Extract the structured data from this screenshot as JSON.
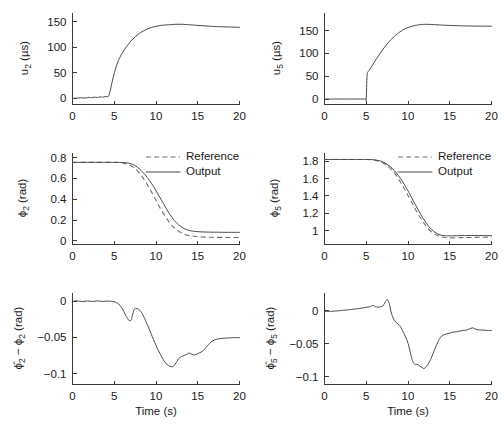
{
  "figure": {
    "background": "#ffffff",
    "line_color": "#4a4a4a",
    "dash_color": "#6e6e6e",
    "axis_color": "#3c3c3c",
    "rows": 3,
    "cols": 2
  },
  "labels": {
    "time_axis": "Time (s)",
    "legend_reference": "Reference",
    "legend_output": "Output",
    "u2_axis": "u₂ (μs)",
    "u5_axis": "u₅ (μs)",
    "phi2_axis": "ϕ₂ (rad)",
    "phi5_axis": "ϕ₅ (rad)",
    "err2_axis": "ϕ̂2 − ϕ₂ (rad)",
    "err5_axis": "ϕ̂5 − ϕ₅ (rad)"
  },
  "chart_data": [
    {
      "id": "u2",
      "type": "line",
      "title": "",
      "xlabel": "",
      "ylabel": "u_2 (μs)",
      "xlim": [
        0,
        20
      ],
      "ylim": [
        -12,
        168
      ],
      "xticks": [
        0,
        5,
        10,
        15,
        20
      ],
      "xticklabels": [
        "0",
        "5",
        "10",
        "15",
        "20"
      ],
      "yticks": [
        0,
        50,
        100,
        150
      ],
      "yticklabels": [
        "0",
        "50",
        "100",
        "150"
      ],
      "grid": false,
      "legend": null,
      "series": [
        {
          "name": "u2",
          "style": "solid",
          "x": [
            0,
            0.5,
            1.0,
            1.5,
            2.0,
            2.3,
            2.6,
            3.0,
            3.3,
            3.6,
            3.9,
            4.1,
            4.3,
            4.5,
            4.8,
            5.1,
            5.5,
            6.0,
            6.5,
            7.0,
            7.5,
            8.0,
            8.5,
            9.0,
            9.5,
            10.0,
            10.5,
            11.0,
            11.5,
            12.0,
            12.5,
            13.0,
            13.5,
            14.0,
            15.0,
            16.0,
            17.0,
            18.0,
            19.0,
            20.0
          ],
          "y": [
            0,
            0.4,
            1.2,
            0.6,
            2.0,
            1.0,
            2.4,
            1.6,
            3.0,
            2.2,
            3.4,
            3.6,
            3.8,
            14,
            36,
            55,
            74,
            90,
            102,
            112,
            120,
            127,
            132,
            136,
            139,
            141,
            142.5,
            143.5,
            144,
            144.6,
            145,
            145,
            144.6,
            144,
            142.8,
            141.6,
            140.6,
            140,
            139.5,
            139
          ]
        }
      ]
    },
    {
      "id": "u5",
      "type": "line",
      "title": "",
      "xlabel": "",
      "ylabel": "u_5 (μs)",
      "xlim": [
        0,
        20
      ],
      "ylim": [
        -12,
        190
      ],
      "xticks": [
        0,
        5,
        10,
        15,
        20
      ],
      "xticklabels": [
        "0",
        "5",
        "10",
        "15",
        "20"
      ],
      "yticks": [
        0,
        50,
        100,
        150
      ],
      "yticklabels": [
        "0",
        "50",
        "100",
        "150"
      ],
      "grid": false,
      "legend": null,
      "series": [
        {
          "name": "u5",
          "style": "solid",
          "x": [
            0,
            1.0,
            2.0,
            3.0,
            4.0,
            4.6,
            4.9,
            5.0,
            5.1,
            5.3,
            5.6,
            6.0,
            6.5,
            7.0,
            7.5,
            8.0,
            8.5,
            9.0,
            9.5,
            10.0,
            10.5,
            11.0,
            11.5,
            12.0,
            12.5,
            13.0,
            14.0,
            15.0,
            16.0,
            17.0,
            18.0,
            19.0,
            20.0
          ],
          "y": [
            0,
            0,
            0,
            0,
            0,
            0,
            0,
            0,
            52,
            62,
            70,
            82,
            96,
            109,
            121,
            131,
            140,
            147,
            153,
            157,
            160,
            162,
            163.5,
            164,
            164,
            163.5,
            162.5,
            161.5,
            161,
            160.5,
            160.2,
            160,
            160
          ]
        }
      ]
    },
    {
      "id": "phi2",
      "type": "line",
      "title": "",
      "xlabel": "",
      "ylabel": "ϕ_2 (rad)",
      "xlim": [
        0,
        20
      ],
      "ylim": [
        -0.035,
        0.85
      ],
      "xticks": [
        0,
        5,
        10,
        15,
        20
      ],
      "xticklabels": [
        "0",
        "5",
        "10",
        "15",
        "20"
      ],
      "yticks": [
        0,
        0.2,
        0.4,
        0.6,
        0.8
      ],
      "yticklabels": [
        "0",
        "0.2",
        "0.4",
        "0.6",
        "0.8"
      ],
      "grid": false,
      "legend": {
        "position": "upper-right",
        "entries": [
          "Reference",
          "Output"
        ]
      },
      "series": [
        {
          "name": "Reference",
          "style": "dashed",
          "x": [
            0,
            2,
            4,
            5,
            5.6,
            6.0,
            6.5,
            7.0,
            7.5,
            8.0,
            8.5,
            9.0,
            9.5,
            10.0,
            10.5,
            11.0,
            11.5,
            12.0,
            12.5,
            13.0,
            13.5,
            14.0,
            14.5,
            15.0,
            16.0,
            17.0,
            18.0,
            19.0,
            20.0
          ],
          "y": [
            0.755,
            0.755,
            0.755,
            0.755,
            0.754,
            0.75,
            0.74,
            0.723,
            0.695,
            0.655,
            0.6,
            0.535,
            0.465,
            0.39,
            0.315,
            0.25,
            0.19,
            0.14,
            0.105,
            0.08,
            0.062,
            0.05,
            0.044,
            0.04,
            0.036,
            0.034,
            0.033,
            0.032,
            0.032
          ]
        },
        {
          "name": "Output",
          "style": "solid",
          "x": [
            0,
            2,
            4,
            5,
            5.6,
            6.2,
            6.7,
            7.0,
            7.4,
            7.8,
            8.2,
            8.7,
            9.2,
            9.7,
            10.2,
            10.7,
            11.2,
            11.7,
            12.2,
            12.7,
            13.2,
            13.7,
            14.2,
            14.8,
            15.5,
            16.5,
            17.5,
            18.5,
            20.0
          ],
          "y": [
            0.755,
            0.755,
            0.755,
            0.755,
            0.755,
            0.753,
            0.748,
            0.742,
            0.728,
            0.707,
            0.678,
            0.635,
            0.583,
            0.523,
            0.455,
            0.385,
            0.315,
            0.25,
            0.196,
            0.155,
            0.126,
            0.107,
            0.096,
            0.09,
            0.086,
            0.084,
            0.083,
            0.082,
            0.082
          ]
        }
      ]
    },
    {
      "id": "phi5",
      "type": "line",
      "title": "",
      "xlabel": "",
      "ylabel": "ϕ_5 (rad)",
      "xlim": [
        0,
        20
      ],
      "ylim": [
        0.84,
        1.9
      ],
      "xticks": [
        0,
        5,
        10,
        15,
        20
      ],
      "xticklabels": [
        "0",
        "5",
        "10",
        "15",
        "20"
      ],
      "yticks": [
        1,
        1.2,
        1.4,
        1.6,
        1.8
      ],
      "yticklabels": [
        "1",
        "1.2",
        "1.4",
        "1.6",
        "1.8"
      ],
      "grid": false,
      "legend": {
        "position": "upper-right",
        "entries": [
          "Reference",
          "Output"
        ]
      },
      "series": [
        {
          "name": "Reference",
          "style": "dashed",
          "x": [
            0,
            2,
            4,
            5,
            5.5,
            6.0,
            6.5,
            7.0,
            7.5,
            8.0,
            8.5,
            9.0,
            9.5,
            10.0,
            10.5,
            11.0,
            11.5,
            12.0,
            12.5,
            13.0,
            13.5,
            14.0,
            14.5,
            15.0,
            16.0,
            17.0,
            18.0,
            19.0,
            20.0
          ],
          "y": [
            1.82,
            1.82,
            1.82,
            1.82,
            1.818,
            1.812,
            1.8,
            1.78,
            1.75,
            1.705,
            1.65,
            1.575,
            1.495,
            1.405,
            1.315,
            1.225,
            1.145,
            1.075,
            1.015,
            0.972,
            0.945,
            0.928,
            0.92,
            0.916,
            0.918,
            0.92,
            0.922,
            0.924,
            0.925
          ]
        },
        {
          "name": "Output",
          "style": "solid",
          "x": [
            0,
            2,
            4,
            5,
            5.5,
            6.0,
            6.6,
            7.1,
            7.6,
            8.1,
            8.6,
            9.1,
            9.6,
            10.1,
            10.6,
            11.1,
            11.6,
            12.1,
            12.6,
            13.1,
            13.6,
            14.1,
            14.6,
            15.2,
            16.0,
            17.0,
            18.0,
            19.0,
            20.0
          ],
          "y": [
            1.82,
            1.82,
            1.82,
            1.82,
            1.819,
            1.815,
            1.805,
            1.787,
            1.758,
            1.718,
            1.665,
            1.6,
            1.525,
            1.44,
            1.35,
            1.26,
            1.175,
            1.1,
            1.035,
            0.99,
            0.96,
            0.945,
            0.94,
            0.94,
            0.942,
            0.943,
            0.943,
            0.943,
            0.942
          ]
        }
      ]
    },
    {
      "id": "err2",
      "type": "line",
      "title": "",
      "xlabel": "Time (s)",
      "ylabel": "ϕ̂2 − ϕ_2 (rad)",
      "xlim": [
        0,
        20
      ],
      "ylim": [
        -0.115,
        0.012
      ],
      "xticks": [
        0,
        5,
        10,
        15,
        20
      ],
      "xticklabels": [
        "0",
        "5",
        "10",
        "15",
        "20"
      ],
      "yticks": [
        0,
        -0.05,
        -0.1
      ],
      "yticklabels": [
        "0",
        "−0.05",
        "−0.1"
      ],
      "grid": false,
      "legend": null,
      "series": [
        {
          "name": "error2",
          "style": "solid",
          "x": [
            0,
            0.6,
            1.2,
            1.8,
            2.4,
            3.0,
            3.6,
            4.2,
            4.8,
            5.1,
            5.4,
            5.7,
            6.0,
            6.3,
            6.6,
            6.8,
            7.0,
            7.15,
            7.3,
            7.45,
            7.6,
            7.9,
            8.2,
            8.5,
            8.8,
            9.1,
            9.4,
            9.7,
            10.0,
            10.3,
            10.6,
            10.9,
            11.2,
            11.5,
            11.8,
            12.1,
            12.3,
            12.5,
            12.7,
            12.9,
            13.2,
            13.5,
            13.8,
            14.0,
            14.2,
            14.5,
            14.8,
            15.1,
            15.4,
            15.7,
            16.0,
            16.3,
            16.6,
            17.0,
            17.4,
            18.0,
            18.6,
            19.2,
            20.0
          ],
          "y": [
            0.0,
            0.0005,
            -0.0005,
            0.0003,
            -0.0004,
            0.0004,
            -0.0003,
            0.0002,
            -0.0004,
            -0.0012,
            -0.003,
            -0.006,
            -0.011,
            -0.018,
            -0.024,
            -0.027,
            -0.0265,
            -0.021,
            -0.014,
            -0.0105,
            -0.0098,
            -0.0112,
            -0.0145,
            -0.0205,
            -0.028,
            -0.036,
            -0.0445,
            -0.053,
            -0.061,
            -0.0685,
            -0.075,
            -0.081,
            -0.0862,
            -0.0888,
            -0.0905,
            -0.0898,
            -0.0868,
            -0.0832,
            -0.0795,
            -0.0772,
            -0.0758,
            -0.0742,
            -0.0725,
            -0.0715,
            -0.0728,
            -0.0742,
            -0.0735,
            -0.0718,
            -0.0702,
            -0.0678,
            -0.0638,
            -0.0596,
            -0.0562,
            -0.0535,
            -0.0522,
            -0.0512,
            -0.0508,
            -0.0505,
            -0.0502
          ]
        }
      ]
    },
    {
      "id": "err5",
      "type": "line",
      "title": "",
      "xlabel": "Time (s)",
      "ylabel": "ϕ̂5 − ϕ_5 (rad)",
      "xlim": [
        0,
        20
      ],
      "ylim": [
        -0.112,
        0.028
      ],
      "xticks": [
        0,
        5,
        10,
        15,
        20
      ],
      "xticklabels": [
        "0",
        "5",
        "10",
        "15",
        "20"
      ],
      "yticks": [
        0,
        -0.05,
        -0.1
      ],
      "yticklabels": [
        "0",
        "−0.05",
        "−0.1"
      ],
      "grid": false,
      "legend": null,
      "series": [
        {
          "name": "error5",
          "style": "solid",
          "x": [
            0,
            0.5,
            1.0,
            1.5,
            2.0,
            2.5,
            3.0,
            3.5,
            4.0,
            4.4,
            4.8,
            5.2,
            5.5,
            5.7,
            5.9,
            6.1,
            6.4,
            6.7,
            7.0,
            7.2,
            7.4,
            7.55,
            7.7,
            7.85,
            8.0,
            8.3,
            8.6,
            8.9,
            9.1,
            9.3,
            9.6,
            9.9,
            10.1,
            10.3,
            10.5,
            10.7,
            10.9,
            11.1,
            11.4,
            11.7,
            11.9,
            12.1,
            12.4,
            12.7,
            13.0,
            13.3,
            13.6,
            13.9,
            14.2,
            14.6,
            15.0,
            15.4,
            15.8,
            16.2,
            16.6,
            17.0,
            17.4,
            17.7,
            18.0,
            18.4,
            19.0,
            19.5,
            20.0
          ],
          "y": [
            -0.001,
            -0.0008,
            -0.0004,
            0.0,
            0.0006,
            0.0012,
            0.0018,
            0.0026,
            0.0034,
            0.0042,
            0.005,
            0.0058,
            0.0068,
            0.0082,
            0.0078,
            0.0062,
            0.0058,
            0.0062,
            0.0078,
            0.0118,
            0.0162,
            0.0172,
            0.0132,
            0.0058,
            -0.0032,
            -0.0128,
            -0.0178,
            -0.0215,
            -0.0235,
            -0.0288,
            -0.0368,
            -0.0452,
            -0.0538,
            -0.0648,
            -0.0742,
            -0.0798,
            -0.0818,
            -0.0812,
            -0.0838,
            -0.0862,
            -0.0878,
            -0.0862,
            -0.0812,
            -0.0742,
            -0.0648,
            -0.0552,
            -0.0468,
            -0.0402,
            -0.0368,
            -0.0352,
            -0.0338,
            -0.0322,
            -0.0318,
            -0.0308,
            -0.0298,
            -0.0292,
            -0.0272,
            -0.0258,
            -0.0272,
            -0.0288,
            -0.0292,
            -0.0298,
            -0.0298
          ]
        }
      ]
    }
  ]
}
